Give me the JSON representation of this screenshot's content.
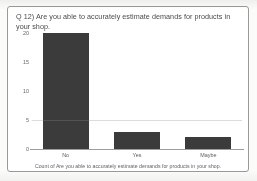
{
  "card": {
    "title": "Q 12) Are you able to accurately estimate demands for products in your shop.",
    "caption": "Count of Are you able to accurately estimate demands for products in your shop."
  },
  "colors": {
    "bar": "#3b3b3b",
    "frame": "#9a9a9a",
    "axis": "#9d9d9d",
    "text": "#4a4a4a",
    "background": "#ffffff"
  },
  "chart_data": {
    "type": "bar",
    "title": "Q 12) Are you able to accurately estimate demands for products in your shop.",
    "categories": [
      "No",
      "Yes",
      "Maybe"
    ],
    "values": [
      20,
      3,
      2
    ],
    "series": [
      {
        "name": "Count of Are you able to accurately estimate demands for products in your shop.",
        "values": [
          20,
          3,
          2
        ]
      }
    ],
    "xlabel": "",
    "ylabel": "",
    "ylim": [
      0,
      20
    ],
    "yticks": [
      0,
      5,
      10,
      15,
      20
    ],
    "ytick_labels": [
      "0",
      "5",
      "10",
      "15",
      "20"
    ],
    "grid": true,
    "legend": false,
    "caption": "Count of Are you able to accurately estimate demands for products in your shop."
  }
}
